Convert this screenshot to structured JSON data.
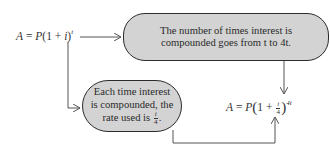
{
  "diagram": {
    "type": "flow",
    "formula_start": {
      "lhs": "A",
      "eq": " = ",
      "p": "P",
      "open": "(1 + ",
      "i": "i",
      "close": ")",
      "exponent": "t"
    },
    "box_top": {
      "line1": "The number of times interest is",
      "line2": "compounded goes from t to 4t."
    },
    "box_bottom": {
      "line1": "Each time interest",
      "line2": "is compounded, the",
      "line3_prefix": "rate used is ",
      "frac_num": "i",
      "frac_den": "4",
      "line3_suffix": "."
    },
    "formula_end": {
      "lhs": "A",
      "eq": " = ",
      "p": "P",
      "one_plus": "1 + ",
      "frac_num": "i",
      "frac_den": "4",
      "exponent": "4t"
    },
    "colors": {
      "box_fill": "#d3d3d3",
      "box_stroke": "#2c2c2c",
      "line": "#444444",
      "text": "#2a2a2a"
    }
  }
}
